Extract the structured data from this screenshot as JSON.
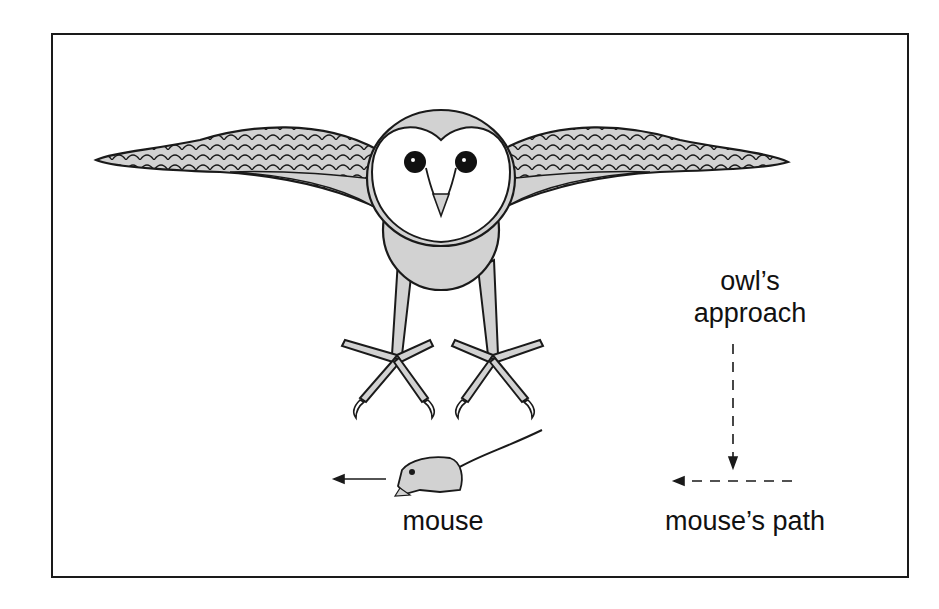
{
  "figure": {
    "colors": {
      "fill": "#d2d2d2",
      "outline": "#1a1a1a",
      "face": "#ffffff",
      "frame": "#1a1a1a"
    }
  },
  "labels": {
    "mouse": "mouse",
    "owl_approach_line1": "owl’s",
    "owl_approach_line2": "approach",
    "mouse_path": "mouse’s path"
  },
  "arrows": [
    {
      "name": "mouse-direction-arrow",
      "direction": "left",
      "style": "solid"
    },
    {
      "name": "owl-approach-arrow",
      "direction": "down",
      "style": "dashed"
    },
    {
      "name": "mouse-path-arrow",
      "direction": "left",
      "style": "dashed"
    }
  ]
}
